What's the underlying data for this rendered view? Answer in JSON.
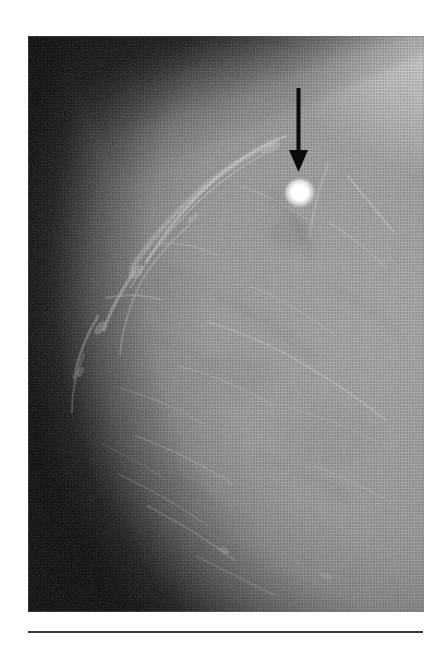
{
  "figure": {
    "kind": "medical-radiograph",
    "modality": "mammogram",
    "view": "craniocaudal",
    "caption": ""
  },
  "plate": {
    "x": 28,
    "y": 36,
    "width": 396,
    "height": 576,
    "background_color": "#060606",
    "tissue_color": "#9c9c9c",
    "tissue_highlight_color": "#c8c8c8",
    "skin_edge_color": "#3a3a3a"
  },
  "annotations": {
    "arrow": {
      "label": "pointer-arrow",
      "color": "#0a0a0a",
      "direction": "down",
      "shaft_x": 298,
      "shaft_top_y": 88,
      "shaft_bottom_y": 152,
      "tip_x": 298,
      "tip_y": 172,
      "head_width": 19,
      "head_height": 22,
      "shaft_width": 4
    },
    "lesion": {
      "label": "bright-opacity",
      "color": "#ffffff",
      "center_x": 300,
      "center_y": 193,
      "diameter": 26,
      "description": "high-density round opacity"
    }
  },
  "rule": {
    "x": 28,
    "y": 631,
    "width": 395,
    "thickness": 2,
    "color": "#3a3a3a"
  }
}
